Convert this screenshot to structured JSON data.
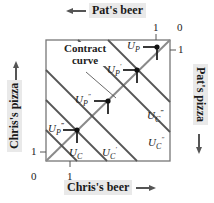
{
  "axes": {
    "top": {
      "title": "Pat's beer",
      "arrow": "left"
    },
    "bottom": {
      "title": "Chris's beer",
      "arrow": "right"
    },
    "left": {
      "title": "Chris's pizza",
      "arrow": "up"
    },
    "right": {
      "title": "Pat's pizza",
      "arrow": "down"
    }
  },
  "ticks": {
    "bottom_origin": "0",
    "bottom_one": "1",
    "left_one": "1",
    "top_one": "1",
    "top_origin": "0",
    "right_one": "1"
  },
  "contract_curve_label": {
    "line1": "Contract",
    "line2": "curve"
  },
  "pat_points": [
    {
      "base": "U",
      "sub": "P",
      "prime": ""
    },
    {
      "base": "U",
      "sub": "P",
      "prime": "′"
    },
    {
      "base": "U",
      "sub": "P",
      "prime": "″"
    },
    {
      "base": "U",
      "sub": "P",
      "prime": "‴"
    }
  ],
  "chris_curves": [
    {
      "base": "U",
      "sub": "C",
      "prime": ""
    },
    {
      "base": "U",
      "sub": "C",
      "prime": "′"
    },
    {
      "base": "U",
      "sub": "C",
      "prime": "″"
    },
    {
      "base": "U",
      "sub": "C",
      "prime": "‴"
    }
  ],
  "colors": {
    "box": "#777777",
    "indifference": "#555555",
    "contract": "#888888",
    "point": "#111111",
    "axis_label_bg": "#e9e9e9"
  }
}
